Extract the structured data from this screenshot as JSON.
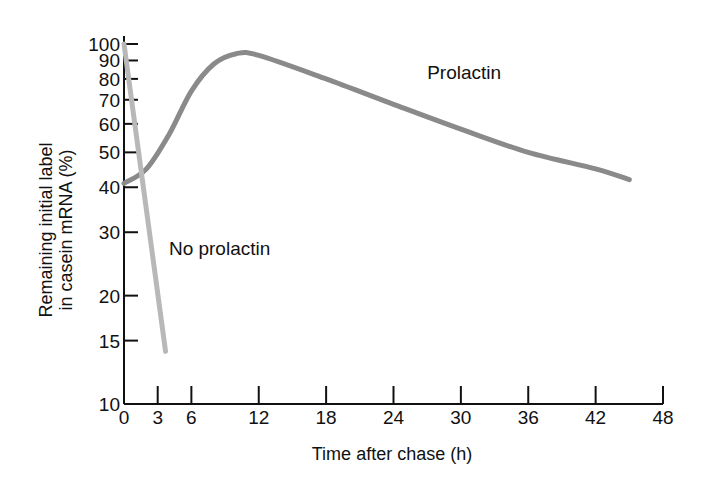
{
  "chart_data": {
    "type": "line",
    "title": "",
    "xlabel": "Time after chase (h)",
    "ylabel_line1": "Remaining initial label",
    "ylabel_line2": "in casein mRNA (%)",
    "xlim": [
      0,
      48
    ],
    "ylim": [
      10,
      100
    ],
    "yscale": "log",
    "grid": false,
    "x_ticks": [
      0,
      3,
      6,
      12,
      18,
      24,
      30,
      36,
      42,
      48
    ],
    "y_ticks": [
      10,
      15,
      20,
      30,
      40,
      50,
      60,
      70,
      80,
      90,
      100
    ],
    "series": [
      {
        "name": "Prolactin",
        "color": "#8a8a8a",
        "x": [
          0,
          2,
          4,
          6,
          8,
          10,
          12,
          18,
          24,
          30,
          36,
          42,
          45
        ],
        "y": [
          41,
          45,
          56,
          74,
          88,
          94,
          93,
          80,
          68,
          58,
          50,
          45,
          42
        ]
      },
      {
        "name": "No prolactin",
        "color": "#b8b8b8",
        "x": [
          0,
          3.7
        ],
        "y": [
          100,
          14
        ]
      }
    ],
    "annotations": [
      {
        "text": "Prolactin",
        "x": 27,
        "y": 80
      },
      {
        "text": "No prolactin",
        "x": 4,
        "y": 26
      }
    ]
  }
}
